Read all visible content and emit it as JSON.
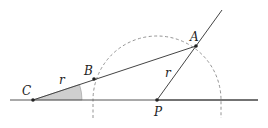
{
  "diagram": {
    "points": {
      "C": {
        "label": "C",
        "x": 33,
        "y": 100
      },
      "B": {
        "label": "B",
        "x": 94,
        "y": 79
      },
      "A": {
        "label": "A",
        "x": 196,
        "y": 46
      },
      "P": {
        "label": "P",
        "x": 157,
        "y": 100
      }
    },
    "segment_labels": {
      "CB": "r",
      "PA": "r"
    },
    "circle": {
      "center": "P",
      "radius": 64,
      "style": "dashed"
    },
    "colors": {
      "line": "#444444",
      "dashed": "#888888",
      "angle_fill": "#cccccc"
    }
  }
}
